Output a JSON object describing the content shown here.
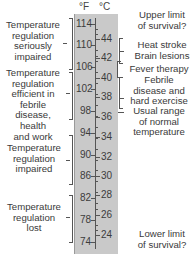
{
  "units": {
    "fahrenheit": "°F",
    "celsius": "°C"
  },
  "scale": {
    "fahrenheit_ticks": [
      "114",
      "110",
      "106",
      "102",
      "98",
      "94",
      "90",
      "86",
      "82",
      "78",
      "74"
    ],
    "celsius_ticks": [
      "44",
      "42",
      "40",
      "38",
      "36",
      "34",
      "32",
      "30",
      "28",
      "26",
      "24"
    ],
    "background_color": "#c9c9c9"
  },
  "left_annotations": [
    {
      "text": "Temperature regulation seriously impaired",
      "lines": [
        "Temperature",
        "regulation",
        "seriously",
        "impaired"
      ],
      "range_f": [
        106,
        114
      ]
    },
    {
      "text": "Temperature regulation efficient in febrile disease, health and work",
      "lines": [
        "Temperature",
        "regulation",
        "efficient in",
        "febrile",
        "disease,",
        "health",
        "and work"
      ],
      "range_f": [
        96,
        106
      ]
    },
    {
      "text": "Temperature regulation impaired",
      "lines": [
        "Temperature",
        "regulation",
        "impaired"
      ],
      "range_f": [
        85,
        95
      ]
    },
    {
      "text": "Temperature regulation lost",
      "lines": [
        "Temperature",
        "regulation",
        "lost"
      ],
      "range_f": [
        74,
        83
      ]
    }
  ],
  "right_annotations": [
    {
      "text": "Upper limit of survival?",
      "lines": [
        "Upper limit",
        "of survival?"
      ]
    },
    {
      "text": "Heat stroke Brain lesions",
      "lines": [
        "Heat stroke",
        "Brain lesions"
      ]
    },
    {
      "text": "Fever therapy",
      "lines": [
        "Fever therapy"
      ]
    },
    {
      "text": "Febrile disease and hard exercise",
      "lines": [
        "Febrile",
        "disease and",
        "hard exercise"
      ]
    },
    {
      "text": "Usual range of normal temperature",
      "lines": [
        "Usual range",
        "of normal",
        "temperature"
      ]
    },
    {
      "text": "Lower limit of survival?",
      "lines": [
        "Lower limit",
        "of survival?"
      ]
    }
  ]
}
